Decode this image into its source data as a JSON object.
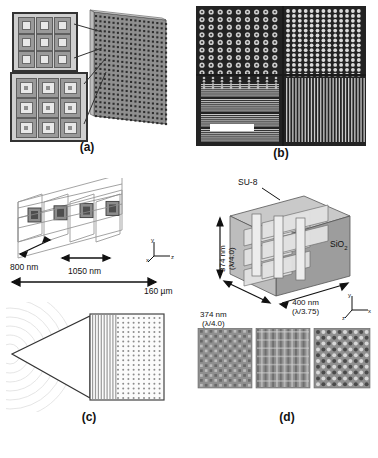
{
  "figure": {
    "panels": [
      {
        "id": "a",
        "caption": "(a)"
      },
      {
        "id": "b",
        "caption": "(b)"
      },
      {
        "id": "c",
        "caption": "(c)"
      },
      {
        "id": "d",
        "caption": "(d)"
      }
    ]
  },
  "panel_a": {
    "caption": "(a)",
    "description": "Schematic of a tilted square-aperture array with zoomed inset showing concentric square unit cells"
  },
  "panel_b": {
    "caption": "(b)",
    "description": "Dark-field SEM micrograph showing four quadrants of periodic dot and line patterns",
    "scalebar_visible": true
  },
  "panel_c": {
    "caption": "(c)",
    "dimensions": {
      "width_label": "800 nm",
      "depth_label": "1050 nm",
      "length_label": "160 µm"
    },
    "axes": [
      "x",
      "y",
      "z"
    ]
  },
  "panel_d": {
    "caption": "(d)",
    "material_top": "SU-8",
    "material_side": "SiO2",
    "material_side_sub": "2",
    "dimensions": [
      {
        "value": "374 nm",
        "ratio": "(λ/4.0)",
        "axis": "vertical"
      },
      {
        "value": "374 nm",
        "ratio": "(λ/4.0)",
        "axis": "left-diagonal"
      },
      {
        "value": "400 nm",
        "ratio": "(λ/3.75)",
        "axis": "right-diagonal"
      }
    ],
    "axes": [
      "x",
      "y",
      "z"
    ],
    "sem_images": 3
  }
}
